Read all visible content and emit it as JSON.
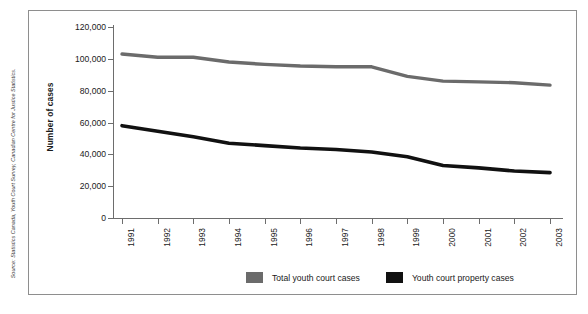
{
  "chart_data": {
    "type": "line",
    "title": "",
    "xlabel": "",
    "ylabel": "Number of cases",
    "categories": [
      "1991",
      "1992",
      "1993",
      "1994",
      "1995",
      "1996",
      "1997",
      "1998",
      "1999",
      "2000",
      "2001",
      "2002",
      "2003"
    ],
    "ylim": [
      0,
      120000
    ],
    "ytick_labels": [
      "0",
      "20,000",
      "40,000",
      "60,000",
      "80,000",
      "100,000",
      "120,000"
    ],
    "ytick_values": [
      0,
      20000,
      40000,
      60000,
      80000,
      100000,
      120000
    ],
    "grid": false,
    "legend_position": "bottom-center",
    "series": [
      {
        "name": "Total youth court cases",
        "color": "#6b6b6b",
        "values": [
          103000,
          101000,
          101000,
          98000,
          96500,
          95500,
          95000,
          95000,
          89000,
          86000,
          85500,
          85000,
          83500
        ]
      },
      {
        "name": "Youth court property cases",
        "color": "#111111",
        "values": [
          58000,
          54500,
          51000,
          47000,
          45500,
          44000,
          43000,
          41500,
          38500,
          33000,
          31500,
          29500,
          28500
        ]
      }
    ]
  },
  "y_axis": {
    "title": "Number of cases"
  },
  "legend": {
    "entries": [
      {
        "label": "Total youth court cases",
        "swatch": "#6b6b6b"
      },
      {
        "label": "Youth court property cases",
        "swatch": "#111111"
      }
    ]
  },
  "source": {
    "text": "Source: Statistics Canada, Youth Court Survey, Canadian Centre for Justice Statistics."
  }
}
